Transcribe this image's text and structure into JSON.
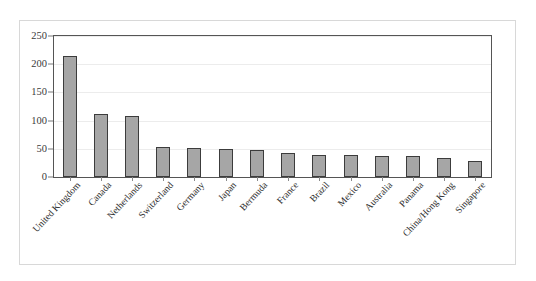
{
  "chart_data": {
    "type": "bar",
    "title": "",
    "subtitle": "",
    "xlabel": "",
    "ylabel": "",
    "ylim": [
      0,
      250
    ],
    "yticks": [
      0,
      50,
      100,
      150,
      200,
      250
    ],
    "grid": true,
    "legend": false,
    "legend_position": "none",
    "bar_fill_color": "#a6a6a6",
    "bar_edge_color": "#3c3c3c",
    "categories": [
      "United Kingdom",
      "Canada",
      "Netherlands",
      "Switzerland",
      "Germany",
      "Japan",
      "Bermuda",
      "France",
      "Brazil",
      "Mexico",
      "Australia",
      "Panama",
      "China/Hong Kong",
      "Singapore"
    ],
    "values": [
      214,
      112,
      108,
      54,
      52,
      50,
      48,
      43,
      39,
      39,
      38,
      38,
      33,
      29
    ]
  }
}
